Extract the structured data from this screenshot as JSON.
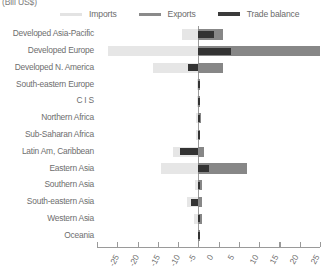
{
  "chart_data": {
    "type": "bar",
    "orientation": "horizontal",
    "title": "",
    "subtitle": "",
    "unit_label": "(Bill US$)",
    "xlabel": "",
    "ylabel": "",
    "xlim": [
      -25,
      30
    ],
    "xticks": [
      -25,
      -20,
      -15,
      -10,
      -5,
      0,
      5,
      10,
      15,
      20,
      25,
      30
    ],
    "xtick_labels": [
      "-25",
      "-20",
      "-15",
      "-10",
      "-5",
      "0",
      "5",
      "10",
      "15",
      "20",
      "25",
      "30"
    ],
    "grid": false,
    "legend_position": "top",
    "categories": [
      "Developed Asia-Pacific",
      "Developed Europe",
      "Developed N. America",
      "South-eastern Europe",
      "C I S",
      "Northern Africa",
      "Sub-Saharan Africa",
      "Latin Am, Caribbean",
      "Eastern Asia",
      "Southern Asia",
      "South-eastern Asia",
      "Western Asia",
      "Oceania"
    ],
    "series": [
      {
        "name": "Imports",
        "color": "#e6e6e6",
        "values": [
          -4.0,
          -22.2,
          -11.2,
          -0.3,
          -0.4,
          -0.5,
          -0.5,
          -6.2,
          -9.3,
          -0.9,
          -2.9,
          -1.1,
          -0.2
        ]
      },
      {
        "name": "Exports",
        "color": "#878787",
        "values": [
          6.0,
          30.0,
          6.1,
          0.3,
          0.5,
          0.6,
          0.5,
          1.3,
          12.0,
          0.8,
          1.0,
          0.9,
          0.2
        ]
      },
      {
        "name": "Trade balance",
        "color": "#333333",
        "values": [
          3.9,
          8.0,
          -2.6,
          0.2,
          0.3,
          0.3,
          0.2,
          -4.6,
          2.6,
          0.4,
          -1.9,
          0.3,
          0.1
        ]
      }
    ],
    "legend": [
      {
        "label": "Imports",
        "color": "#e6e6e6"
      },
      {
        "label": "Exports",
        "color": "#878787"
      },
      {
        "label": "Trade balance",
        "color": "#333333"
      }
    ]
  }
}
